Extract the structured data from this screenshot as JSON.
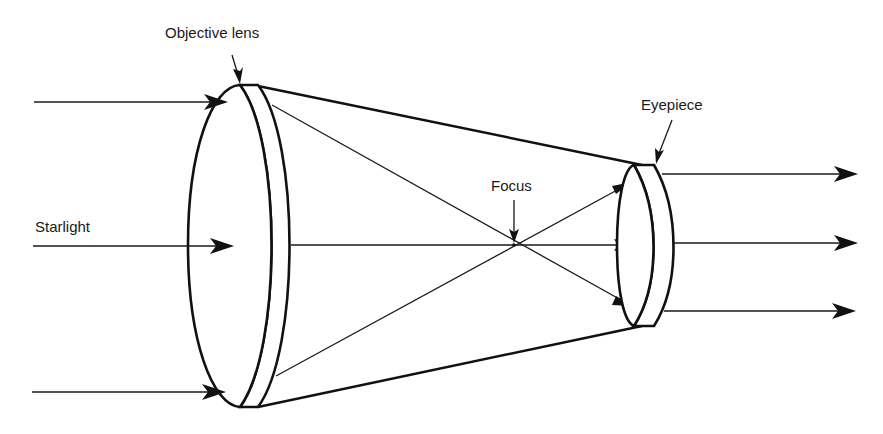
{
  "diagram": {
    "labels": {
      "objective_lens": "Objective lens",
      "eyepiece": "Eyepiece",
      "focus": "Focus",
      "starlight": "Starlight"
    },
    "components": [
      {
        "id": "objective-lens",
        "label": "Objective lens"
      },
      {
        "id": "eyepiece",
        "label": "Eyepiece"
      },
      {
        "id": "focus-point",
        "label": "Focus"
      }
    ],
    "incoming_rays": 3,
    "outgoing_rays": 3,
    "colors": {
      "line": "#111111",
      "background": "#ffffff"
    }
  }
}
